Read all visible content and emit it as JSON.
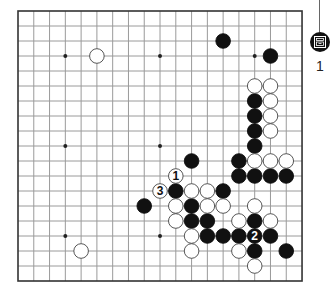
{
  "board": {
    "size": 19,
    "origin_x": 18,
    "origin_y": 11,
    "spacing_x": 15.78,
    "spacing_y": 15.0,
    "line_color": "#9a9a9a",
    "border_color": "#333333",
    "star_points": [
      [
        3,
        3
      ],
      [
        9,
        3
      ],
      [
        15,
        3
      ],
      [
        3,
        9
      ],
      [
        9,
        9
      ],
      [
        15,
        9
      ],
      [
        3,
        15
      ],
      [
        9,
        15
      ],
      [
        15,
        15
      ]
    ],
    "stones": {
      "black": [
        [
          13,
          2
        ],
        [
          16,
          3
        ],
        [
          15,
          6
        ],
        [
          15,
          7
        ],
        [
          15,
          8
        ],
        [
          15,
          9
        ],
        [
          11,
          10
        ],
        [
          14,
          10
        ],
        [
          14,
          11
        ],
        [
          15,
          11
        ],
        [
          16,
          11
        ],
        [
          17,
          11
        ],
        [
          10,
          12
        ],
        [
          13,
          12
        ],
        [
          8,
          13
        ],
        [
          11,
          13
        ],
        [
          11,
          14
        ],
        [
          12,
          14
        ],
        [
          15,
          14
        ],
        [
          12,
          15
        ],
        [
          13,
          15
        ],
        [
          14,
          15
        ],
        [
          15,
          15
        ],
        [
          16,
          15
        ],
        [
          15,
          16
        ],
        [
          17,
          16
        ]
      ],
      "white": [
        [
          5,
          3
        ],
        [
          15,
          5
        ],
        [
          16,
          5
        ],
        [
          16,
          6
        ],
        [
          16,
          7
        ],
        [
          16,
          8
        ],
        [
          15,
          10
        ],
        [
          16,
          10
        ],
        [
          17,
          10
        ],
        [
          10,
          11
        ],
        [
          9,
          12
        ],
        [
          11,
          12
        ],
        [
          12,
          12
        ],
        [
          10,
          13
        ],
        [
          12,
          13
        ],
        [
          13,
          13
        ],
        [
          15,
          13
        ],
        [
          10,
          14
        ],
        [
          14,
          14
        ],
        [
          16,
          14
        ],
        [
          11,
          15
        ],
        [
          4,
          16
        ],
        [
          11,
          16
        ],
        [
          14,
          16
        ],
        [
          15,
          17
        ]
      ]
    },
    "labels": [
      {
        "x": 10,
        "y": 11,
        "text": "1",
        "stone": "white"
      },
      {
        "x": 15,
        "y": 15,
        "text": "2",
        "stone": "black"
      },
      {
        "x": 9,
        "y": 12,
        "text": "3",
        "stone": "white"
      }
    ]
  },
  "side_panel": {
    "icon": "scroll-maze-icon",
    "number": "1"
  }
}
